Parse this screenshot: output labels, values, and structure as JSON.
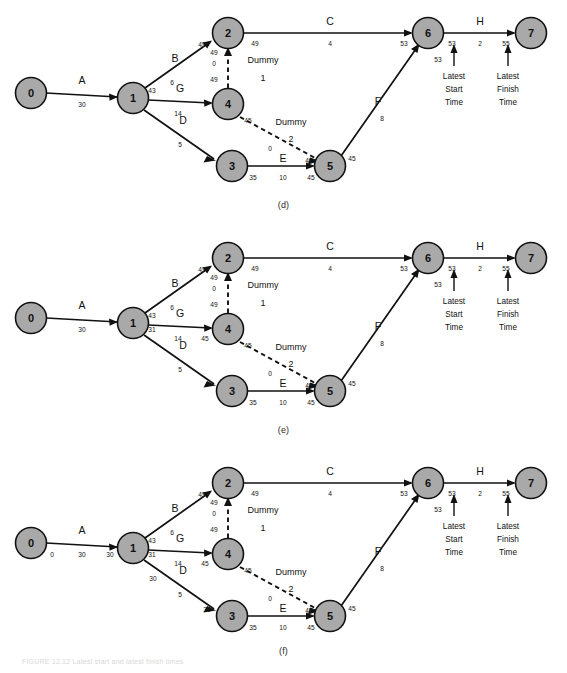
{
  "figure": {
    "caption": "FIGURE 12.12  Latest start and latest finish times",
    "node_fill": "#a9a9a9",
    "stroke": "#111111"
  },
  "panels": [
    {
      "id": "d",
      "label": "(d)",
      "nodes": [
        {
          "id": "n0",
          "label": "0",
          "cx": 31,
          "cy": 93
        },
        {
          "id": "n1",
          "label": "1",
          "cx": 133,
          "cy": 98
        },
        {
          "id": "n2",
          "label": "2",
          "cx": 228,
          "cy": 33
        },
        {
          "id": "n4",
          "label": "4",
          "cx": 228,
          "cy": 104
        },
        {
          "id": "n3",
          "label": "3",
          "cx": 232,
          "cy": 166
        },
        {
          "id": "n5",
          "label": "5",
          "cx": 330,
          "cy": 166
        },
        {
          "id": "n6",
          "label": "6",
          "cx": 428,
          "cy": 33
        },
        {
          "id": "n7",
          "label": "7",
          "cx": 531,
          "cy": 33
        }
      ],
      "activities": [
        {
          "name": "A",
          "duration": "30"
        },
        {
          "name": "B",
          "duration": "6"
        },
        {
          "name": "G",
          "duration": "14"
        },
        {
          "name": "D",
          "duration": "5"
        },
        {
          "name": "C",
          "duration": "4"
        },
        {
          "name": "E",
          "duration": "10"
        },
        {
          "name": "F",
          "duration": "8"
        },
        {
          "name": "H",
          "duration": "2"
        },
        {
          "name": "Dummy 1",
          "duration": "0"
        },
        {
          "name": "Dummy 2",
          "duration": "0"
        }
      ],
      "times": [
        {
          "name": "t-b-tail",
          "value": "43",
          "x": 152,
          "y": 90
        },
        {
          "name": "t-b-head",
          "value": "49",
          "x": 202,
          "y": 44
        },
        {
          "name": "t-c-tail",
          "value": "49",
          "x": 255,
          "y": 43
        },
        {
          "name": "t-c-head",
          "value": "53",
          "x": 404,
          "y": 43
        },
        {
          "name": "t-dummy1-head",
          "value": "49",
          "x": 214,
          "y": 52
        },
        {
          "name": "t-dummy1-tail",
          "value": "49",
          "x": 214,
          "y": 79
        },
        {
          "name": "t-g-head",
          "value": "45",
          "x": 248,
          "y": 120
        },
        {
          "name": "t-e-tail",
          "value": "35",
          "x": 253,
          "y": 177
        },
        {
          "name": "t-e-head",
          "value": "45",
          "x": 311,
          "y": 177
        },
        {
          "name": "t-dummy2-head",
          "value": "45",
          "x": 309,
          "y": 160
        },
        {
          "name": "t-f-tail",
          "value": "45",
          "x": 352,
          "y": 158
        },
        {
          "name": "t-f-head",
          "value": "53",
          "x": 438,
          "y": 59
        },
        {
          "name": "t-h-tail",
          "value": "53",
          "x": 452,
          "y": 43
        },
        {
          "name": "t-h-head",
          "value": "55",
          "x": 506,
          "y": 43
        }
      ],
      "annotations": [
        {
          "name": "latest-start-time",
          "lines": [
            "Latest",
            "Start",
            "Time"
          ],
          "x": 454,
          "y": 76
        },
        {
          "name": "latest-finish-time",
          "lines": [
            "Latest",
            "Finish",
            "Time"
          ],
          "x": 508,
          "y": 76
        }
      ]
    },
    {
      "id": "e",
      "label": "(e)",
      "extra_times": [
        {
          "name": "t-node1-lower",
          "value": "31",
          "x": 152,
          "y": 104
        },
        {
          "name": "t-g-mid",
          "value": "45",
          "x": 205,
          "y": 113
        }
      ]
    },
    {
      "id": "f",
      "label": "(f)",
      "extra_times": [
        {
          "name": "t-node1-lower",
          "value": "31",
          "x": 152,
          "y": 104
        },
        {
          "name": "t-g-mid",
          "value": "45",
          "x": 205,
          "y": 113
        },
        {
          "name": "t-node0",
          "value": "0",
          "x": 52,
          "y": 104
        },
        {
          "name": "t-a-head",
          "value": "30",
          "x": 110,
          "y": 104
        },
        {
          "name": "t-d-tail",
          "value": "30",
          "x": 153,
          "y": 128
        },
        {
          "name": "t-d-head",
          "value": "35",
          "x": 207,
          "y": 159
        }
      ]
    }
  ]
}
